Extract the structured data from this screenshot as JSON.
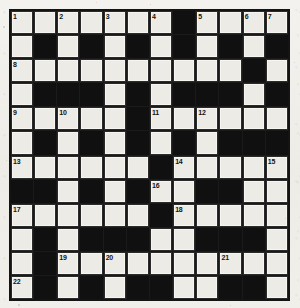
{
  "puzzle": {
    "title": "Crossword Grid",
    "type": "crossword",
    "rows": 12,
    "cols": 12,
    "colors": {
      "paper": "#f1efea",
      "white_cell": "#edebe5",
      "black_cell": "#111010",
      "grid_line": "#1a1a1a",
      "number_text": "#15130f"
    },
    "grid": [
      [
        "1",
        "",
        "2",
        "",
        "3",
        "",
        "4",
        "#",
        "5",
        "",
        "6",
        "7"
      ],
      [
        "",
        "#",
        "",
        "#",
        "",
        "#",
        "",
        "#",
        "",
        "#",
        "",
        "#"
      ],
      [
        "8",
        "",
        "",
        "",
        "",
        "",
        "",
        "",
        "",
        "",
        "#",
        ""
      ],
      [
        "",
        "#",
        "#",
        "#",
        "",
        "#",
        "",
        "#",
        "#",
        "#",
        "",
        "#"
      ],
      [
        "9",
        "",
        "10",
        "",
        "",
        "#",
        "11",
        "",
        "12",
        "",
        "",
        ""
      ],
      [
        "",
        "#",
        "",
        "#",
        "",
        "#",
        "",
        "#",
        "",
        "#",
        "#",
        "#"
      ],
      [
        "13",
        "",
        "",
        "",
        "",
        "",
        "#",
        "14",
        "",
        "",
        "",
        "15"
      ],
      [
        "#",
        "#",
        "",
        "#",
        "",
        "#",
        "16",
        "",
        "#",
        "#",
        "",
        ""
      ],
      [
        "17",
        "",
        "",
        "",
        "",
        "",
        "#",
        "18",
        "",
        "",
        "",
        ""
      ],
      [
        "",
        "#",
        "",
        "#",
        "#",
        "#",
        "",
        "",
        "#",
        "#",
        "#",
        ""
      ],
      [
        "",
        "#",
        "19",
        "",
        "20",
        "",
        "",
        "",
        "",
        "21",
        "",
        ""
      ],
      [
        "",
        "#",
        "",
        "#",
        "",
        "#",
        "#",
        "",
        "",
        "#",
        "#",
        ""
      ],
      [
        "22",
        "",
        "",
        "",
        "",
        "#",
        "23",
        "",
        "",
        "",
        "",
        ""
      ]
    ],
    "black_squares": [
      [
        0,
        7
      ],
      [
        1,
        1
      ],
      [
        1,
        3
      ],
      [
        1,
        5
      ],
      [
        1,
        7
      ],
      [
        1,
        9
      ],
      [
        1,
        11
      ],
      [
        2,
        10
      ],
      [
        3,
        1
      ],
      [
        3,
        2
      ],
      [
        3,
        3
      ],
      [
        3,
        5
      ],
      [
        3,
        7
      ],
      [
        3,
        8
      ],
      [
        3,
        9
      ],
      [
        3,
        11
      ],
      [
        4,
        5
      ],
      [
        5,
        1
      ],
      [
        5,
        3
      ],
      [
        5,
        5
      ],
      [
        5,
        7
      ],
      [
        5,
        9
      ],
      [
        5,
        10
      ],
      [
        5,
        11
      ],
      [
        6,
        6
      ],
      [
        7,
        0
      ],
      [
        7,
        1
      ],
      [
        7,
        3
      ],
      [
        7,
        5
      ],
      [
        7,
        8
      ],
      [
        7,
        9
      ],
      [
        8,
        6
      ],
      [
        9,
        1
      ],
      [
        9,
        3
      ],
      [
        9,
        4
      ],
      [
        9,
        5
      ],
      [
        9,
        8
      ],
      [
        9,
        9
      ],
      [
        9,
        10
      ],
      [
        10,
        1
      ],
      [
        11,
        1
      ],
      [
        11,
        3
      ],
      [
        11,
        5
      ],
      [
        11,
        6
      ],
      [
        11,
        9
      ],
      [
        11,
        10
      ]
    ],
    "clue_numbers": [
      {
        "n": "1",
        "row": 0,
        "col": 0
      },
      {
        "n": "2",
        "row": 0,
        "col": 2
      },
      {
        "n": "3",
        "row": 0,
        "col": 4
      },
      {
        "n": "4",
        "row": 0,
        "col": 6
      },
      {
        "n": "5",
        "row": 0,
        "col": 8
      },
      {
        "n": "6",
        "row": 0,
        "col": 10
      },
      {
        "n": "7",
        "row": 0,
        "col": 11
      },
      {
        "n": "8",
        "row": 2,
        "col": 0
      },
      {
        "n": "9",
        "row": 4,
        "col": 0
      },
      {
        "n": "10",
        "row": 4,
        "col": 2
      },
      {
        "n": "11",
        "row": 4,
        "col": 6
      },
      {
        "n": "12",
        "row": 4,
        "col": 8
      },
      {
        "n": "13",
        "row": 6,
        "col": 0
      },
      {
        "n": "14",
        "row": 6,
        "col": 7
      },
      {
        "n": "15",
        "row": 6,
        "col": 11
      },
      {
        "n": "16",
        "row": 7,
        "col": 6
      },
      {
        "n": "17",
        "row": 8,
        "col": 0
      },
      {
        "n": "18",
        "row": 8,
        "col": 7
      },
      {
        "n": "19",
        "row": 10,
        "col": 2
      },
      {
        "n": "20",
        "row": 10,
        "col": 4
      },
      {
        "n": "21",
        "row": 10,
        "col": 9
      },
      {
        "n": "22",
        "row": 11,
        "col": 0
      },
      {
        "n": "23",
        "row": 11,
        "col": 6
      }
    ],
    "specks": [
      {
        "x": 3,
        "y": 26,
        "s": 1.6
      },
      {
        "x": 294,
        "y": 62,
        "s": 1.4
      },
      {
        "x": 18,
        "y": 304,
        "s": 1.5
      },
      {
        "x": 150,
        "y": 4,
        "s": 1.2
      },
      {
        "x": 285,
        "y": 218,
        "s": 1.3
      },
      {
        "x": 6,
        "y": 160,
        "s": 1.2
      },
      {
        "x": 230,
        "y": 305,
        "s": 1.4
      },
      {
        "x": 96,
        "y": 2,
        "s": 1.1
      }
    ]
  }
}
